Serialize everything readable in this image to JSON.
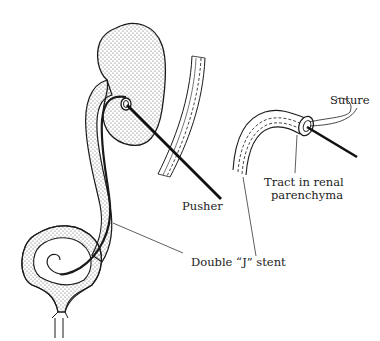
{
  "figure": {
    "type": "medical-illustration",
    "colors": {
      "ink": "#1a1a1a",
      "background": "#ffffff",
      "stipple": "#555555"
    }
  },
  "labels": {
    "pusher": "Pusher",
    "suture": "Suture",
    "tract_line1": "Tract in renal",
    "tract_line2": "parenchyma",
    "stent": "Double “J” stent"
  },
  "parts": [
    "kidney",
    "ureter",
    "bladder",
    "double-j-stent",
    "pusher-rod",
    "stent-detail-inset",
    "tract-detail-inset"
  ]
}
